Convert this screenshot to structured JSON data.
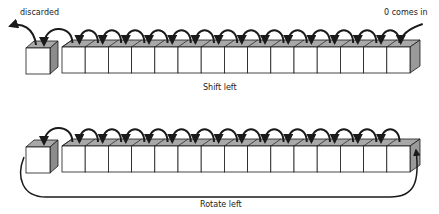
{
  "diagram": {
    "shift": {
      "title": "Shift left",
      "discarded_label": "discarded",
      "incoming_label": "0 comes in",
      "cell_count": 15
    },
    "rotate": {
      "title": "Rotate left",
      "cell_count": 15
    },
    "colors": {
      "stroke": "#1a1a1a",
      "face": "#ffffff",
      "top_face": "#a8a8a8",
      "side_face": "#9a9a9a"
    }
  }
}
